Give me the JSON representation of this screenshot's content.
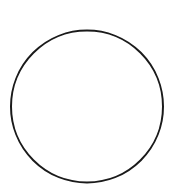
{
  "diagram": {
    "background": "#ffffff",
    "shapes": [
      {
        "type": "circle",
        "cx": 87,
        "cy": 106.5,
        "r": 76,
        "stroke": "#1a1a1a",
        "stroke_width": 2,
        "fill": "none"
      }
    ]
  }
}
